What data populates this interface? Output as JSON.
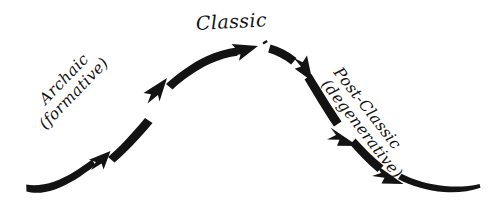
{
  "diagram": {
    "type": "hand-drawn-arc-timeline",
    "ink_color": "#131313",
    "background_color": "#ffffff",
    "stages": [
      {
        "id": "archaic",
        "line_1": "Archaic",
        "line_2": "(formative)",
        "position": "rising-limb-left",
        "rotation_deg": -46
      },
      {
        "id": "classic",
        "line_1": "Classic",
        "line_2": "",
        "position": "apex-center",
        "rotation_deg": -3
      },
      {
        "id": "post-classic",
        "line_1": "Post-Classic",
        "line_2": "(degenerative)",
        "position": "falling-limb-right",
        "rotation_deg": 52
      }
    ],
    "arrowheads": [
      {
        "id": "arrowhead-1",
        "x": 98,
        "y": 162,
        "angle_deg": -44,
        "segment": "rising"
      },
      {
        "id": "arrowhead-2",
        "x": 154,
        "y": 92,
        "angle_deg": -50,
        "segment": "rising"
      },
      {
        "id": "arrowhead-3",
        "x": 240,
        "y": 53,
        "angle_deg": -6,
        "segment": "apex"
      },
      {
        "id": "arrowhead-4",
        "x": 303,
        "y": 68,
        "angle_deg": 33,
        "segment": "falling"
      },
      {
        "id": "arrowhead-5",
        "x": 349,
        "y": 133,
        "angle_deg": 60,
        "segment": "falling"
      },
      {
        "id": "arrowhead-6",
        "x": 393,
        "y": 173,
        "angle_deg": 52,
        "segment": "falling"
      }
    ],
    "curve": {
      "start_x": 26,
      "start_y": 192,
      "apex_x": 250,
      "apex_y": 48,
      "end_x": 481,
      "end_y": 188
    }
  }
}
